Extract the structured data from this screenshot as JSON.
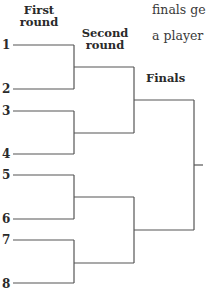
{
  "headers": {
    "first_round_line1": "First",
    "first_round_line2": "round",
    "second_round_line1": "Second",
    "second_round_line2": "round",
    "finals": "Finals"
  },
  "prose": {
    "line1": "finals ge",
    "line2": "a player"
  },
  "seeds": [
    "1",
    "2",
    "3",
    "4",
    "5",
    "6",
    "7",
    "8"
  ],
  "colors": {
    "line": "#555555",
    "text": "#2a2a2a",
    "background": "#ffffff"
  }
}
